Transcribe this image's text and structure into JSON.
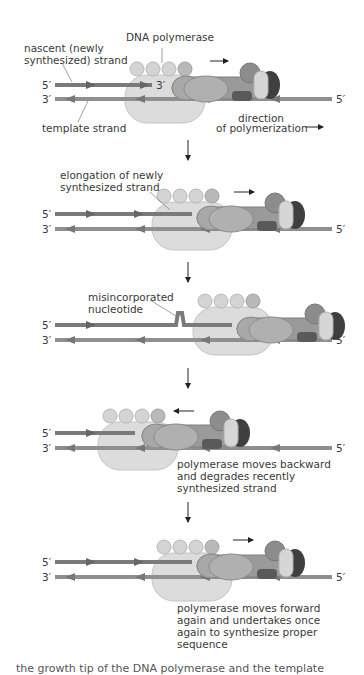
{
  "figure": {
    "colors": {
      "nascent_strand": "#7a7a7a",
      "template_strand": "#8f8f8f",
      "polymerase_body": "#dcdcdc",
      "subunit_light": "#cfcfcf",
      "subunit_mid": "#9d9d9d",
      "subunit_dark": "#5a5a5a",
      "arrow": "#222222",
      "text": "#3a3a3a"
    },
    "panels": [
      {
        "id": "initial",
        "labels": {
          "polymerase": "DNA polymerase",
          "nascent_line1": "nascent (newly",
          "nascent_line2": "synthesized) strand",
          "template": "template strand",
          "direction_line1": "direction",
          "direction_line2": "of polymerization"
        },
        "ends": {
          "top_left": "5′",
          "top_right": "3′",
          "bottom_left": "3′",
          "bottom_right": "5′"
        }
      },
      {
        "id": "elongation",
        "labels": {
          "line1": "elongation of newly",
          "line2": "synthesized strand"
        },
        "ends": {
          "top_left": "5′",
          "bottom_left": "3′",
          "bottom_right": "5′"
        }
      },
      {
        "id": "misincorporation",
        "labels": {
          "line1": "misincorporated",
          "line2": "nucleotide"
        },
        "ends": {
          "top_left": "5′",
          "bottom_left": "3′",
          "bottom_right": "5′"
        }
      },
      {
        "id": "backward",
        "labels": {
          "line1": "polymerase moves backward",
          "line2": "and degrades recently",
          "line3": "synthesized strand"
        },
        "ends": {
          "top_left": "5′",
          "bottom_left": "3′",
          "bottom_right": "5′"
        }
      },
      {
        "id": "forward",
        "labels": {
          "line1": "polymerase moves forward",
          "line2": "again and undertakes once",
          "line3": "again to synthesize proper",
          "line4": "sequence"
        },
        "ends": {
          "top_left": "5′",
          "bottom_left": "3′",
          "bottom_right": "5′"
        }
      }
    ],
    "caption_partial": "the growth tip of the DNA polymerase and the template"
  }
}
